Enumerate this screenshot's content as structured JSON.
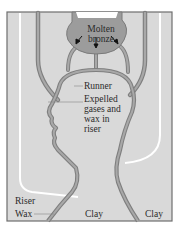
{
  "diagram": {
    "type": "lost-wax bronze casting cross-section",
    "colors": {
      "background": "#ffffff",
      "clay": "#d9d9d9",
      "frame": "#6e6e6e",
      "channel": "#9a9a9a",
      "channel_edge": "#7a7a7a",
      "molten_bronze": "#9c9c9c",
      "white_line": "#ffffff",
      "text": "#2a2a2a"
    },
    "labels": {
      "molten": "Molten",
      "bronze": "bronze",
      "runner": "Runner",
      "expelled": [
        "Expelled",
        "gases and",
        "wax in",
        "riser"
      ],
      "riser": "Riser",
      "wax": "Wax",
      "clay_left": "Clay",
      "clay_right": "Clay"
    },
    "arrows": [
      "down-left",
      "down",
      "down-right"
    ]
  }
}
